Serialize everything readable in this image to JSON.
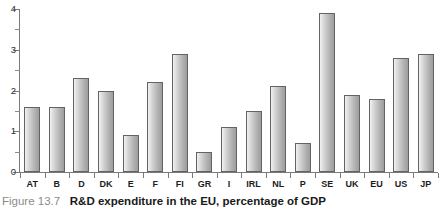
{
  "caption": {
    "figure_number": "Figure 13.7",
    "title": "R&D expenditure in the EU, percentage of GDP"
  },
  "chart_data": {
    "type": "bar",
    "title": "R&D expenditure in the EU, percentage of GDP",
    "xlabel": "",
    "ylabel": "",
    "ylim": [
      0,
      4
    ],
    "yticks": [
      0,
      1,
      2,
      3,
      4
    ],
    "ytick_labels": [
      "0",
      "1",
      "2",
      "3",
      "4"
    ],
    "minor_tick_interval": 0.5,
    "grid": false,
    "legend": false,
    "categories": [
      "AT",
      "B",
      "D",
      "DK",
      "E",
      "F",
      "FI",
      "GR",
      "I",
      "IRL",
      "NL",
      "P",
      "SE",
      "UK",
      "EU",
      "US",
      "JP"
    ],
    "values": [
      1.6,
      1.6,
      2.3,
      2.0,
      0.9,
      2.2,
      2.9,
      0.5,
      1.1,
      1.5,
      2.1,
      0.7,
      3.9,
      1.9,
      1.8,
      2.8,
      2.9
    ],
    "bar_color": "#c9c9c9",
    "bar_edge_color": "#636363"
  }
}
